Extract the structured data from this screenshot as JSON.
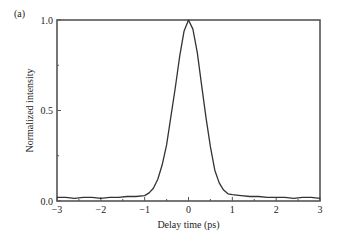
{
  "panel_label": "(a)",
  "chart_data": {
    "type": "line",
    "title": "",
    "xlabel": "Delay time (ps)",
    "ylabel": "Normalized intensity",
    "xlim": [
      -3,
      3
    ],
    "ylim": [
      0,
      1
    ],
    "xticks": [
      -3,
      -2,
      -1,
      0,
      1,
      2,
      3
    ],
    "xtick_labels": [
      "−3",
      "−2",
      "−1",
      "0",
      "1",
      "2",
      "3"
    ],
    "yticks": [
      0.0,
      0.5,
      1.0
    ],
    "ytick_labels": [
      "0.0",
      "0.5",
      "1.0"
    ],
    "grid": false,
    "legend": null,
    "series": [
      {
        "name": "Autocorrelation trace",
        "x": [
          -3.0,
          -2.8,
          -2.6,
          -2.4,
          -2.2,
          -2.0,
          -1.8,
          -1.6,
          -1.4,
          -1.2,
          -1.0,
          -0.9,
          -0.8,
          -0.7,
          -0.6,
          -0.5,
          -0.4,
          -0.3,
          -0.2,
          -0.1,
          0.0,
          0.1,
          0.2,
          0.3,
          0.4,
          0.5,
          0.6,
          0.7,
          0.8,
          0.9,
          1.0,
          1.2,
          1.4,
          1.6,
          1.8,
          2.0,
          2.2,
          2.4,
          2.6,
          2.8,
          3.0
        ],
        "y": [
          0.02,
          0.02,
          0.015,
          0.02,
          0.02,
          0.015,
          0.02,
          0.02,
          0.025,
          0.025,
          0.03,
          0.045,
          0.07,
          0.12,
          0.2,
          0.31,
          0.47,
          0.63,
          0.8,
          0.94,
          1.0,
          0.95,
          0.82,
          0.64,
          0.46,
          0.3,
          0.17,
          0.1,
          0.06,
          0.04,
          0.035,
          0.03,
          0.025,
          0.025,
          0.02,
          0.02,
          0.02,
          0.015,
          0.02,
          0.02,
          0.015
        ]
      }
    ]
  }
}
